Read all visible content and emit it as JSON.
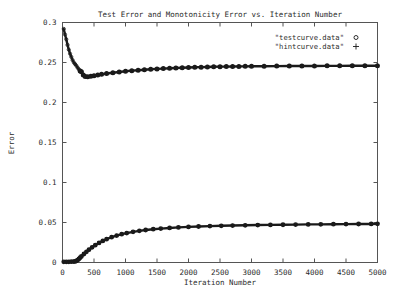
{
  "chart_data": {
    "type": "line",
    "title": "Test Error and Monotonicity Error vs. Iteration Number",
    "xlabel": "Iteration Number",
    "ylabel": "Error",
    "xlim": [
      0,
      5000
    ],
    "ylim": [
      0,
      0.3
    ],
    "grid": false,
    "legend_position": "top-right",
    "xticks": [
      0,
      500,
      1000,
      1500,
      2000,
      2500,
      3000,
      3500,
      4000,
      4500,
      5000
    ],
    "xtick_labels": [
      "0",
      "500",
      "1000",
      "1500",
      "2000",
      "2500",
      "3000",
      "3500",
      "4000",
      "4500",
      "5000"
    ],
    "yticks": [
      0,
      0.05,
      0.1,
      0.15,
      0.2,
      0.25,
      0.3
    ],
    "ytick_labels": [
      "0",
      "0.05",
      "0.1",
      "0.15",
      "0.2",
      "0.25",
      "0.3"
    ],
    "series": [
      {
        "name": "\"testcurve.data\"",
        "marker": "circle",
        "marker_glyph": "○",
        "color": "#1a1a1a",
        "x": [
          20,
          40,
          60,
          80,
          100,
          120,
          140,
          160,
          180,
          200,
          220,
          240,
          260,
          280,
          300,
          330,
          360,
          400,
          450,
          500,
          560,
          620,
          700,
          800,
          900,
          1000,
          1100,
          1200,
          1300,
          1400,
          1500,
          1600,
          1700,
          1800,
          1900,
          2000,
          2100,
          2200,
          2300,
          2400,
          2500,
          2600,
          2700,
          2800,
          2900,
          3000,
          3200,
          3400,
          3600,
          3800,
          4000,
          4200,
          4400,
          4600,
          4800,
          5000
        ],
        "y": [
          0.292,
          0.285,
          0.279,
          0.272,
          0.266,
          0.261,
          0.257,
          0.253,
          0.25,
          0.248,
          0.246,
          0.2435,
          0.2415,
          0.2395,
          0.2385,
          0.2345,
          0.2325,
          0.2322,
          0.2328,
          0.2335,
          0.2345,
          0.2352,
          0.2362,
          0.2372,
          0.2382,
          0.239,
          0.2398,
          0.2404,
          0.241,
          0.2415,
          0.242,
          0.2424,
          0.2428,
          0.2431,
          0.2434,
          0.2437,
          0.244,
          0.2442,
          0.2444,
          0.2446,
          0.2448,
          0.2449,
          0.245,
          0.2451,
          0.2452,
          0.2453,
          0.2454,
          0.2455,
          0.2456,
          0.2457,
          0.2457,
          0.2458,
          0.2458,
          0.2459,
          0.2459,
          0.246
        ]
      },
      {
        "name": "\"hintcurve.data\"",
        "marker": "plus",
        "marker_glyph": "+",
        "color": "#1a1a1a",
        "x": [
          20,
          60,
          100,
          140,
          180,
          200,
          220,
          240,
          260,
          280,
          300,
          340,
          380,
          420,
          470,
          520,
          580,
          640,
          700,
          780,
          860,
          940,
          1020,
          1120,
          1220,
          1320,
          1440,
          1560,
          1700,
          1840,
          2000,
          2160,
          2340,
          2520,
          2700,
          2900,
          3100,
          3300,
          3500,
          3700,
          3900,
          4100,
          4300,
          4500,
          4700,
          4900,
          5000
        ],
        "y": [
          0.0008,
          0.0008,
          0.0009,
          0.001,
          0.0012,
          0.0014,
          0.002,
          0.003,
          0.0044,
          0.006,
          0.0076,
          0.0106,
          0.0134,
          0.016,
          0.019,
          0.0216,
          0.0245,
          0.027,
          0.0292,
          0.0316,
          0.0337,
          0.0354,
          0.0368,
          0.0383,
          0.0396,
          0.0406,
          0.0416,
          0.0424,
          0.0432,
          0.0439,
          0.0445,
          0.045,
          0.0455,
          0.0459,
          0.0462,
          0.0465,
          0.0468,
          0.047,
          0.0472,
          0.0474,
          0.0476,
          0.0477,
          0.0479,
          0.048,
          0.0481,
          0.0482,
          0.0483
        ]
      }
    ]
  }
}
